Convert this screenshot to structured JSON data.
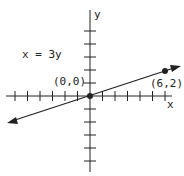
{
  "diagram": {
    "equation_label": "x = 3y",
    "axis_labels": {
      "x": "x",
      "y": "y"
    },
    "points": [
      {
        "label": "(0,0)",
        "x": 0,
        "y": 0
      },
      {
        "label": "(6,2)",
        "x": 6,
        "y": 2
      }
    ],
    "line": {
      "equation": "x = 3y",
      "arrows": "both"
    },
    "x_ticks": [
      -6,
      -5,
      -4,
      -3,
      -2,
      -1,
      1,
      2,
      3,
      4,
      5,
      6
    ],
    "y_ticks": [
      -5,
      -4,
      -3,
      -2,
      -1,
      1,
      2,
      3,
      4,
      5
    ],
    "colors": {
      "ink": "#222222",
      "background": "#ffffff"
    }
  }
}
